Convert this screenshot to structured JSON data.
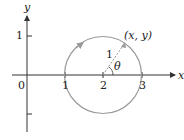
{
  "diagram": {
    "axes": {
      "x_label": "x",
      "y_label": "y",
      "origin_label": "0",
      "x_ticks": [
        "1",
        "2",
        "3"
      ],
      "y_ticks": [
        "1"
      ]
    },
    "circle": {
      "center": [
        2,
        0
      ],
      "radius": 1,
      "color": "#9a9a9a",
      "direction": "counterclockwise"
    },
    "point_label": "(x, y)",
    "radius_label": "1",
    "angle_label": "θ",
    "colors": {
      "axes": "#333333",
      "circle": "#9a9a9a",
      "radius_line": "#9a9a9a"
    }
  }
}
